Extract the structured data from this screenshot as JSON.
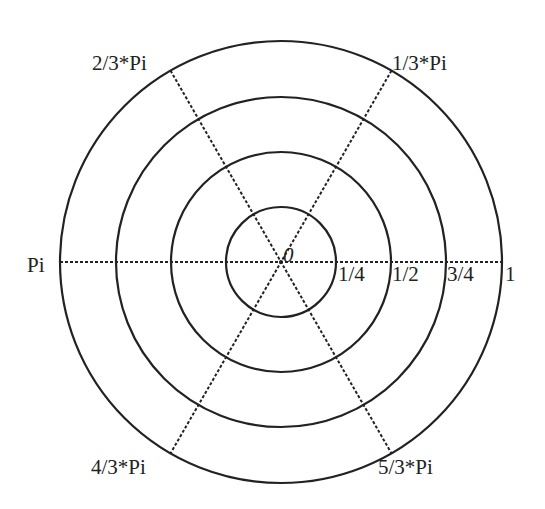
{
  "diagram": {
    "type": "polar-grid",
    "center": {
      "x": 281,
      "y": 262
    },
    "line_color": "#222222",
    "background": "#ffffff",
    "rings": [
      {
        "value": 0.25,
        "radius": 55,
        "label": "1/4"
      },
      {
        "value": 0.5,
        "radius": 110,
        "label": "1/2"
      },
      {
        "value": 0.75,
        "radius": 165,
        "label": "3/4"
      },
      {
        "value": 1.0,
        "radius": 221,
        "label": "1"
      }
    ],
    "origin_label": "0",
    "spokes": [
      {
        "angle_deg": 0,
        "label": ""
      },
      {
        "angle_deg": 60,
        "label": "1/3*Pi"
      },
      {
        "angle_deg": 120,
        "label": "2/3*Pi"
      },
      {
        "angle_deg": 180,
        "label": "Pi"
      },
      {
        "angle_deg": 240,
        "label": "4/3*Pi"
      },
      {
        "angle_deg": 300,
        "label": "5/3*Pi"
      }
    ]
  }
}
